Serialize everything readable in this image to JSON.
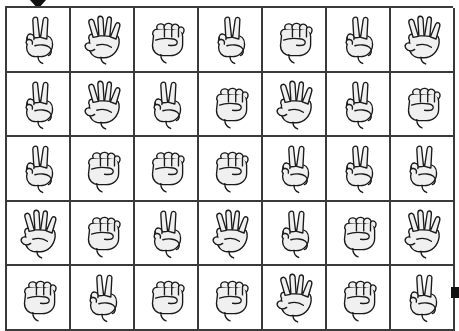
{
  "page": {
    "background_color": "#ffffff",
    "grid_line_color": "#3a3a3a",
    "hand_fill_color": "#f0f0f0",
    "hand_outline_color": "#1a1a1a",
    "marker_color": "#111111"
  },
  "markers": [
    {
      "name": "top-triangle-marker",
      "shape": "triangle-down",
      "x": 30,
      "y": 0,
      "width": 16,
      "height": 9
    },
    {
      "name": "right-square-marker",
      "shape": "square",
      "x": 451,
      "y": 287,
      "width": 8,
      "height": 11
    }
  ],
  "grid": {
    "columns": 7,
    "rows": 5,
    "cell_count": 35,
    "gesture_legend": {
      "rock": "closed fist",
      "paper": "open hand",
      "scissors": "two-finger V sign"
    },
    "cells": [
      {
        "row": 1,
        "col": 1,
        "gesture": "scissors",
        "fingers": 2
      },
      {
        "row": 1,
        "col": 2,
        "gesture": "paper",
        "fingers": 4
      },
      {
        "row": 1,
        "col": 3,
        "gesture": "rock",
        "fingers": 0
      },
      {
        "row": 1,
        "col": 4,
        "gesture": "scissors",
        "fingers": 2
      },
      {
        "row": 1,
        "col": 5,
        "gesture": "rock",
        "fingers": 0
      },
      {
        "row": 1,
        "col": 6,
        "gesture": "scissors",
        "fingers": 2
      },
      {
        "row": 1,
        "col": 7,
        "gesture": "paper",
        "fingers": 4
      },
      {
        "row": 2,
        "col": 1,
        "gesture": "scissors",
        "fingers": 2
      },
      {
        "row": 2,
        "col": 2,
        "gesture": "paper",
        "fingers": 4
      },
      {
        "row": 2,
        "col": 3,
        "gesture": "scissors",
        "fingers": 2
      },
      {
        "row": 2,
        "col": 4,
        "gesture": "rock",
        "fingers": 0
      },
      {
        "row": 2,
        "col": 5,
        "gesture": "paper",
        "fingers": 4
      },
      {
        "row": 2,
        "col": 6,
        "gesture": "scissors",
        "fingers": 2
      },
      {
        "row": 2,
        "col": 7,
        "gesture": "rock",
        "fingers": 0
      },
      {
        "row": 3,
        "col": 1,
        "gesture": "scissors",
        "fingers": 2
      },
      {
        "row": 3,
        "col": 2,
        "gesture": "rock",
        "fingers": 0
      },
      {
        "row": 3,
        "col": 3,
        "gesture": "rock",
        "fingers": 0
      },
      {
        "row": 3,
        "col": 4,
        "gesture": "rock",
        "fingers": 0
      },
      {
        "row": 3,
        "col": 5,
        "gesture": "scissors",
        "fingers": 2
      },
      {
        "row": 3,
        "col": 6,
        "gesture": "scissors",
        "fingers": 2
      },
      {
        "row": 3,
        "col": 7,
        "gesture": "scissors",
        "fingers": 2
      },
      {
        "row": 4,
        "col": 1,
        "gesture": "paper",
        "fingers": 4
      },
      {
        "row": 4,
        "col": 2,
        "gesture": "rock",
        "fingers": 0
      },
      {
        "row": 4,
        "col": 3,
        "gesture": "scissors",
        "fingers": 2
      },
      {
        "row": 4,
        "col": 4,
        "gesture": "paper",
        "fingers": 4
      },
      {
        "row": 4,
        "col": 5,
        "gesture": "scissors",
        "fingers": 2
      },
      {
        "row": 4,
        "col": 6,
        "gesture": "rock",
        "fingers": 0
      },
      {
        "row": 4,
        "col": 7,
        "gesture": "paper",
        "fingers": 4
      },
      {
        "row": 5,
        "col": 1,
        "gesture": "rock",
        "fingers": 0
      },
      {
        "row": 5,
        "col": 2,
        "gesture": "scissors",
        "fingers": 2
      },
      {
        "row": 5,
        "col": 3,
        "gesture": "rock",
        "fingers": 0
      },
      {
        "row": 5,
        "col": 4,
        "gesture": "rock",
        "fingers": 0
      },
      {
        "row": 5,
        "col": 5,
        "gesture": "paper",
        "fingers": 4
      },
      {
        "row": 5,
        "col": 6,
        "gesture": "rock",
        "fingers": 0
      },
      {
        "row": 5,
        "col": 7,
        "gesture": "scissors",
        "fingers": 2
      }
    ]
  }
}
